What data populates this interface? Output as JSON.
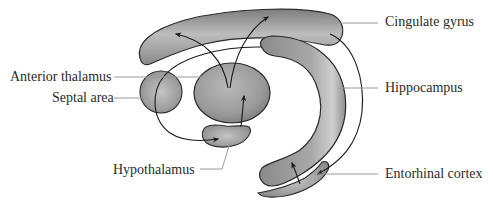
{
  "figure": {
    "labels": {
      "cingulate_gyrus": "Cingulate gyrus",
      "anterior_thalamus": "Anterior thalamus",
      "septal_area": "Septal area",
      "hippocampus": "Hippocampus",
      "hypothalamus": "Hypothalamus",
      "entorhinal_cortex": "Entorhinal cortex"
    },
    "colors": {
      "structure_fill": "#9a9a9a",
      "structure_light": "#c8c8c8",
      "structure_dark": "#6e6e6e",
      "outline": "#2a2a2a",
      "leader_line": "#9a9a9a",
      "text": "#2b2b2b",
      "background": "#ffffff"
    }
  }
}
